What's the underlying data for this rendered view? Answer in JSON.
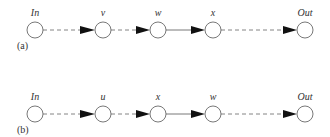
{
  "diagrams": [
    {
      "panel_label": "(a)",
      "nodes": [
        {
          "id": "In",
          "label": "In",
          "x": 35
        },
        {
          "id": "v",
          "label": "v",
          "x": 103
        },
        {
          "id": "w",
          "label": "w",
          "x": 158
        },
        {
          "id": "x",
          "label": "x",
          "x": 213
        },
        {
          "id": "Out",
          "label": "Out",
          "x": 305
        }
      ],
      "edges": [
        {
          "from": "In",
          "to": "v",
          "style": "dashed"
        },
        {
          "from": "v",
          "to": "w",
          "style": "dashed"
        },
        {
          "from": "w",
          "to": "x",
          "style": "solid"
        },
        {
          "from": "x",
          "to": "Out",
          "style": "dashed"
        }
      ]
    },
    {
      "panel_label": "(b)",
      "nodes": [
        {
          "id": "In",
          "label": "In",
          "x": 35
        },
        {
          "id": "u",
          "label": "u",
          "x": 103
        },
        {
          "id": "x",
          "label": "x",
          "x": 158
        },
        {
          "id": "w",
          "label": "w",
          "x": 213
        },
        {
          "id": "Out",
          "label": "Out",
          "x": 305
        }
      ],
      "edges": [
        {
          "from": "In",
          "to": "u",
          "style": "dashed"
        },
        {
          "from": "u",
          "to": "x",
          "style": "dashed"
        },
        {
          "from": "x",
          "to": "w",
          "style": "solid"
        },
        {
          "from": "w",
          "to": "Out",
          "style": "dashed"
        }
      ]
    }
  ]
}
